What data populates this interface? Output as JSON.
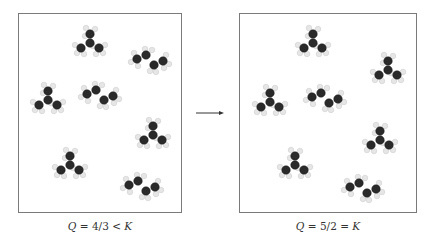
{
  "figure": {
    "arrow": "reaction-progress-arrow",
    "left_panel": {
      "label_q": "Q",
      "label_rest": " = 4/3 < ",
      "label_k": "K",
      "molecules": [
        {
          "type": "isobutane",
          "x": 90,
          "y": 43
        },
        {
          "type": "butane",
          "x": 150,
          "y": 62
        },
        {
          "type": "isobutane",
          "x": 48,
          "y": 100
        },
        {
          "type": "butane",
          "x": 100,
          "y": 97
        },
        {
          "type": "isobutane",
          "x": 153,
          "y": 135
        },
        {
          "type": "isobutane",
          "x": 70,
          "y": 165
        },
        {
          "type": "butane",
          "x": 142,
          "y": 188
        }
      ]
    },
    "right_panel": {
      "label_q": "Q",
      "label_rest": " = 5/2 = ",
      "label_k": "K",
      "molecules": [
        {
          "type": "isobutane",
          "x": 313,
          "y": 43
        },
        {
          "type": "isobutane",
          "x": 388,
          "y": 70
        },
        {
          "type": "isobutane",
          "x": 270,
          "y": 102
        },
        {
          "type": "butane",
          "x": 325,
          "y": 100
        },
        {
          "type": "isobutane",
          "x": 380,
          "y": 140
        },
        {
          "type": "isobutane",
          "x": 295,
          "y": 165
        },
        {
          "type": "butane",
          "x": 363,
          "y": 190
        }
      ]
    },
    "colors": {
      "carbon": "#2a2a2a",
      "hydrogen": "#e6e6e6",
      "border": "#7a7a7a",
      "text": "#333333"
    }
  }
}
